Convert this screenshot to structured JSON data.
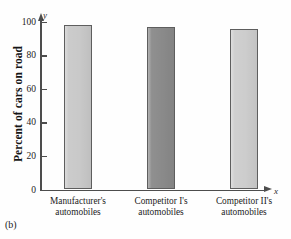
{
  "caption": "(b)",
  "axis_vars": {
    "y": "y",
    "x": "x"
  },
  "chart_data": {
    "type": "bar",
    "title": "",
    "subtitle": "",
    "xlabel": "",
    "ylabel": "Percent of cars on road",
    "categories": [
      "Manufacturer's automobiles",
      "Competitor I's automobiles",
      "Competitor II's automobiles"
    ],
    "category_lines": [
      [
        "Manufacturer's",
        "automobiles"
      ],
      [
        "Competitor I's",
        "automobiles"
      ],
      [
        "Competitor II's",
        "automobiles"
      ]
    ],
    "values": [
      98,
      97,
      96
    ],
    "bar_colors": [
      "#c9c9c9",
      "#8a8a8a",
      "#cdcdcd"
    ],
    "ylim": [
      0,
      105
    ],
    "yticks": [
      0,
      20,
      40,
      60,
      80,
      100
    ],
    "ytick_labels": [
      "0",
      "20",
      "40",
      "60",
      "80",
      "100"
    ],
    "grid": false,
    "legend": null,
    "legend_position": "none",
    "annotations": []
  }
}
